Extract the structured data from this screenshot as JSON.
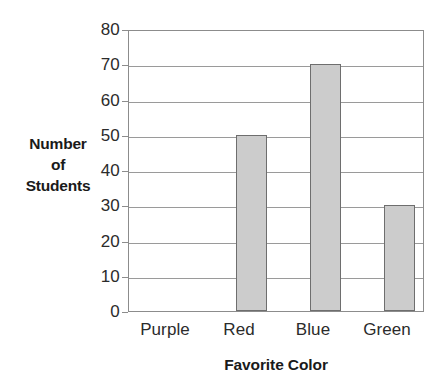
{
  "chart_data": {
    "type": "bar",
    "title": "",
    "categories": [
      "Purple",
      "Red",
      "Blue",
      "Green"
    ],
    "values": [
      0,
      50,
      70,
      30
    ],
    "series": [
      {
        "name": "Number of Students",
        "values": [
          0,
          50,
          70,
          30
        ]
      }
    ],
    "xlabel": "Favorite Color",
    "ylabel": "Number of Students",
    "ylabel_lines": [
      "Number",
      "of",
      "Students"
    ],
    "ylim": [
      0,
      80
    ],
    "ytick_step": 10,
    "yticks": [
      0,
      10,
      20,
      30,
      40,
      50,
      60,
      70,
      80
    ],
    "ytick_labels": [
      "0",
      "10",
      "20",
      "30",
      "40",
      "50",
      "60",
      "70",
      "80"
    ],
    "grid": true,
    "grid_axis": "y",
    "legend": false,
    "legend_position": "none",
    "bar_fill_color": "#cccccc",
    "bar_border_color": "#6e6e6e",
    "gridline_color": "#9a9a9a",
    "axis_color": "#8c8c8c",
    "text_color": "#2b2b2b"
  }
}
